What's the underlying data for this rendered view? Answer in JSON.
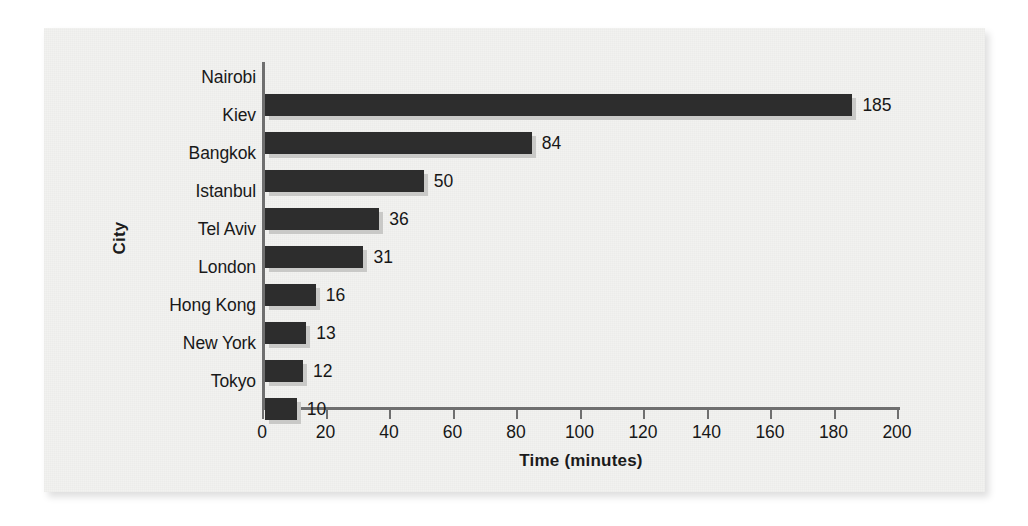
{
  "figure": {
    "panel_background": "#f2f2f0",
    "bar_color": "#2d2d2d",
    "bar_shadow_color": "#c9c9c7",
    "axis_color": "#6f6f6f",
    "text_color": "#171717"
  },
  "chart_data": {
    "type": "bar",
    "orientation": "horizontal",
    "title": "",
    "xlabel": "Time (minutes)",
    "ylabel": "City",
    "categories": [
      "Nairobi",
      "Kiev",
      "Bangkok",
      "Istanbul",
      "Tel Aviv",
      "London",
      "Hong Kong",
      "New York",
      "Tokyo"
    ],
    "values": [
      185,
      84,
      50,
      36,
      31,
      16,
      13,
      12,
      10
    ],
    "value_labels": [
      "185",
      "84",
      "50",
      "36",
      "31",
      "16",
      "13",
      "12",
      "10"
    ],
    "xlim": [
      0,
      200
    ],
    "xticks": [
      0,
      20,
      40,
      60,
      80,
      100,
      120,
      140,
      160,
      180,
      200
    ],
    "xtick_labels": [
      "0",
      "20",
      "40",
      "60",
      "80",
      "100",
      "120",
      "140",
      "160",
      "180",
      "200"
    ],
    "grid": false,
    "legend": false,
    "legend_position": "none",
    "series": [
      {
        "name": "Time (minutes)",
        "values": [
          185,
          84,
          50,
          36,
          31,
          16,
          13,
          12,
          10
        ]
      }
    ]
  }
}
